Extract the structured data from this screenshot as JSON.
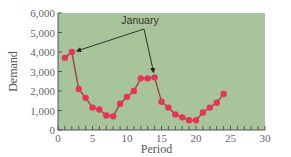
{
  "chart_data": {
    "type": "line",
    "title": "",
    "xlabel": "Period",
    "ylabel": "Demand",
    "xlim": [
      0,
      30
    ],
    "ylim": [
      0,
      6000
    ],
    "x_ticks": [
      0,
      5,
      10,
      15,
      20,
      25,
      30
    ],
    "x_tick_labels": [
      "0",
      "5",
      "10",
      "15",
      "20",
      "25",
      "30"
    ],
    "y_ticks": [
      0,
      1000,
      2000,
      3000,
      4000,
      5000,
      6000
    ],
    "y_tick_labels": [
      "0",
      "1,000",
      "2,000",
      "3,000",
      "4,000",
      "5,000",
      "6,000"
    ],
    "grid": false,
    "legend": null,
    "series": [
      {
        "name": "Demand",
        "x": [
          1,
          2,
          3,
          4,
          5,
          6,
          7,
          8,
          9,
          10,
          11,
          12,
          13,
          14,
          15,
          16,
          17,
          18,
          19,
          20,
          21,
          22,
          23,
          24
        ],
        "values": [
          3700,
          4000,
          2100,
          1650,
          1150,
          1050,
          750,
          700,
          1350,
          1700,
          2000,
          2650,
          2650,
          2700,
          1450,
          1150,
          800,
          650,
          500,
          500,
          900,
          1150,
          1400,
          1850
        ]
      }
    ],
    "annotations": [
      {
        "text": "January",
        "points_to": [
          {
            "x": 2,
            "y": 4000
          },
          {
            "x": 14,
            "y": 2700
          }
        ]
      }
    ]
  },
  "style": {
    "plot_background": "#a8c49a",
    "line_color": "#a0443c",
    "marker_color": "#e8325a",
    "axis_color": "#555555",
    "arrow_color": "#222222"
  }
}
